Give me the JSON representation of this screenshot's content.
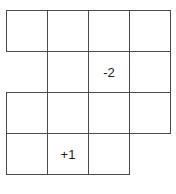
{
  "figure": {
    "name": "grid-staircase-figure",
    "background_color": "#ffffff",
    "line_color": "#4a4a4a",
    "text_color": "#1c1c1c",
    "columns": 4,
    "rows": 4,
    "cell_size_px": 41,
    "origin": {
      "x": 6,
      "y": 10
    }
  },
  "cells": [
    {
      "id": "cell-r1c1",
      "row": 1,
      "col": 1,
      "label": ""
    },
    {
      "id": "cell-r1c2",
      "row": 1,
      "col": 2,
      "label": ""
    },
    {
      "id": "cell-r1c3",
      "row": 1,
      "col": 3,
      "label": ""
    },
    {
      "id": "cell-r1c4",
      "row": 1,
      "col": 4,
      "label": ""
    },
    {
      "id": "cell-r2c2",
      "row": 2,
      "col": 2,
      "label": ""
    },
    {
      "id": "cell-r2c3",
      "row": 2,
      "col": 3,
      "label": "-2"
    },
    {
      "id": "cell-r2c4",
      "row": 2,
      "col": 4,
      "label": ""
    },
    {
      "id": "cell-r3c1",
      "row": 3,
      "col": 1,
      "label": ""
    },
    {
      "id": "cell-r3c2",
      "row": 3,
      "col": 2,
      "label": ""
    },
    {
      "id": "cell-r3c3",
      "row": 3,
      "col": 3,
      "label": ""
    },
    {
      "id": "cell-r3c4",
      "row": 3,
      "col": 4,
      "label": ""
    },
    {
      "id": "cell-r4c1",
      "row": 4,
      "col": 1,
      "label": ""
    },
    {
      "id": "cell-r4c2",
      "row": 4,
      "col": 2,
      "label": "+1"
    },
    {
      "id": "cell-r4c3",
      "row": 4,
      "col": 3,
      "label": ""
    }
  ],
  "labels": [
    {
      "id": "label-minus-two",
      "text": "-2",
      "row": 2,
      "col": 3
    },
    {
      "id": "label-plus-one",
      "text": "+1",
      "row": 4,
      "col": 2
    }
  ]
}
